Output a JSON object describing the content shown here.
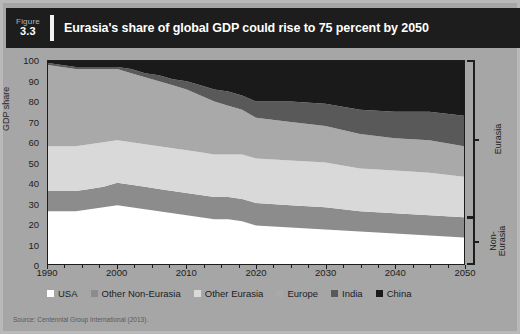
{
  "figure": {
    "number_word": "Figure",
    "number": "3.3",
    "title": "Eurasia's share of global GDP could rise to 75 percent by 2050",
    "source": "Source: Centennial Group International (2013)."
  },
  "brackets": [
    {
      "label": "Eurasia",
      "from": 23,
      "to": 100
    },
    {
      "label": "Non-\nEurasia",
      "label_line1": "Non-",
      "label_line2": "Eurasia",
      "from": 0,
      "to": 23
    }
  ],
  "colors": {
    "panel": "#a6a6a6",
    "header": "#1d1d1d",
    "usa": "#ffffff",
    "other_non_eurasia": "#8c8c8c",
    "other_eurasia": "#d9d9d9",
    "europe": "#a9a9a9",
    "india": "#595959",
    "china": "#1a1a1a"
  },
  "chart_data": {
    "type": "area",
    "stacked": true,
    "title": "Eurasia's share of global GDP could rise to 75 percent by 2050",
    "xlabel": "",
    "ylabel": "GDP share",
    "xlim": [
      1990,
      2050
    ],
    "ylim": [
      0,
      100
    ],
    "grid": false,
    "legend_position": "bottom",
    "xticks": [
      1990,
      2000,
      2010,
      2020,
      2030,
      2040,
      2050
    ],
    "yticks": [
      0,
      10,
      20,
      30,
      40,
      50,
      60,
      70,
      80,
      90,
      100
    ],
    "x": [
      1990,
      1992,
      1994,
      1996,
      1998,
      2000,
      2002,
      2004,
      2006,
      2008,
      2010,
      2012,
      2014,
      2016,
      2018,
      2020,
      2025,
      2030,
      2035,
      2040,
      2045,
      2050
    ],
    "series": [
      {
        "name": "USA",
        "color": "#ffffff",
        "values": [
          26,
          26,
          26,
          27,
          28,
          29,
          28,
          27,
          26,
          25,
          24,
          23,
          22,
          22,
          21,
          19,
          18,
          17,
          16,
          15,
          14,
          13
        ]
      },
      {
        "name": "Other Non-Eurasia",
        "color": "#8c8c8c",
        "values": [
          10,
          10,
          10,
          10,
          10,
          11,
          11,
          11,
          11,
          11,
          11,
          11,
          11,
          11,
          11,
          11,
          11,
          11,
          10,
          10,
          10,
          10
        ]
      },
      {
        "name": "Other Eurasia",
        "color": "#d9d9d9",
        "values": [
          22,
          22,
          22,
          22,
          22,
          21,
          21,
          21,
          21,
          21,
          21,
          21,
          21,
          21,
          22,
          22,
          22,
          22,
          21,
          21,
          21,
          20
        ]
      },
      {
        "name": "Europe",
        "color": "#a9a9a9",
        "values": [
          40,
          39,
          38,
          37,
          36,
          35,
          34,
          33,
          32,
          31,
          30,
          28,
          26,
          24,
          22,
          20,
          19,
          18,
          17,
          16,
          16,
          15
        ]
      },
      {
        "name": "India",
        "color": "#595959",
        "values": [
          1,
          1,
          1,
          1,
          1,
          1,
          2,
          2,
          3,
          3,
          4,
          5,
          6,
          7,
          7,
          8,
          10,
          11,
          12,
          13,
          14,
          15
        ]
      },
      {
        "name": "China",
        "color": "#1a1a1a",
        "values": [
          1,
          2,
          3,
          3,
          3,
          3,
          4,
          6,
          7,
          9,
          10,
          12,
          14,
          15,
          17,
          20,
          20,
          21,
          24,
          25,
          25,
          27
        ]
      }
    ],
    "legend": [
      "USA",
      "Other Non-Eurasia",
      "Other Eurasia",
      "Europe",
      "India",
      "China"
    ]
  }
}
